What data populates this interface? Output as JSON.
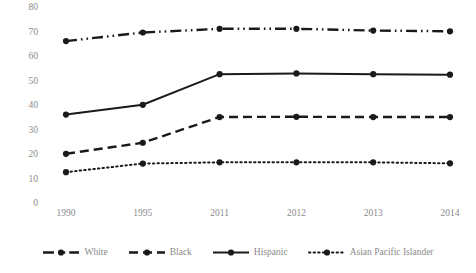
{
  "chart_data": {
    "type": "line",
    "title": "",
    "subtitle": "",
    "xlabel": "",
    "ylabel": "",
    "categories": [
      "1990",
      "1995",
      "2011",
      "2012",
      "2013",
      "2014"
    ],
    "ylim": [
      0,
      80
    ],
    "yticks": [
      0,
      10,
      20,
      30,
      40,
      50,
      60,
      70,
      80
    ],
    "ytick_labels": [
      "0",
      "10",
      "20",
      "30",
      "40",
      "50",
      "60",
      "70",
      "80"
    ],
    "grid": false,
    "legend_position": "bottom",
    "series": [
      {
        "name": "White",
        "values": [
          66.5,
          70.0,
          71.5,
          71.5,
          70.8,
          70.5
        ],
        "line_style": "dash-dot-dot",
        "marker": "circle",
        "color": "#1a1a1a"
      },
      {
        "name": "Black",
        "values": [
          20.5,
          25.0,
          35.5,
          35.6,
          35.5,
          35.5
        ],
        "line_style": "dashed",
        "marker": "circle",
        "color": "#1a1a1a"
      },
      {
        "name": "Hispanic",
        "values": [
          36.5,
          40.5,
          53.0,
          53.3,
          53.0,
          52.8
        ],
        "line_style": "solid",
        "marker": "circle",
        "color": "#1a1a1a"
      },
      {
        "name": "Asian Pacific Islander",
        "values": [
          13.0,
          16.5,
          17.0,
          17.0,
          17.0,
          16.6
        ],
        "line_style": "dotted",
        "marker": "circle",
        "color": "#1a1a1a"
      }
    ]
  },
  "axis": {
    "tick_label_color": "#8a8a8a"
  }
}
